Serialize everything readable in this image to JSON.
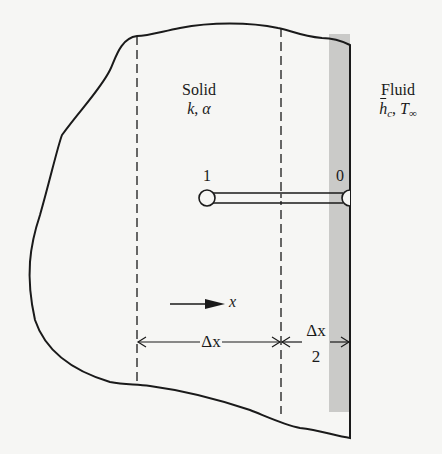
{
  "labels": {
    "solid_title": "Solid",
    "solid_props_k": "k",
    "solid_props_sep": ", ",
    "solid_props_alpha": "α",
    "fluid_title": "Fluid",
    "fluid_h": "h",
    "fluid_h_sub": "c",
    "fluid_sep": ", ",
    "fluid_T": "T",
    "fluid_T_sub": "∞",
    "node_1": "1",
    "node_0": "0",
    "axis_x": "x",
    "dim_dx": "Δx",
    "dim_half_num": "Δx",
    "dim_half_den": "2"
  },
  "colors": {
    "ink": "#1a1a1a",
    "background": "#f6f6f4",
    "surface_strip": "#c9c9c7"
  }
}
